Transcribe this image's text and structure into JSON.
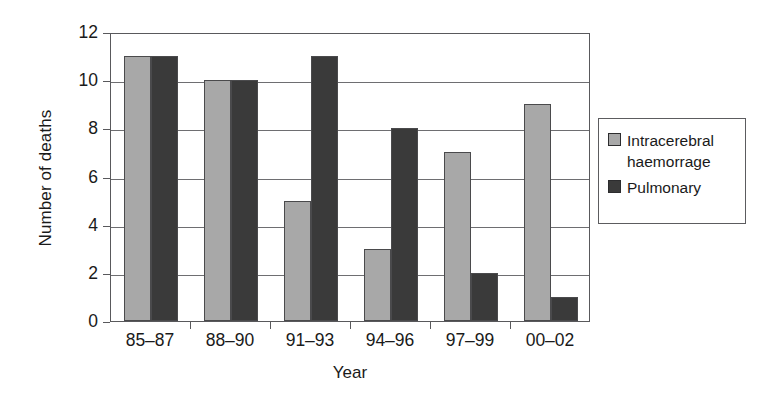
{
  "chart_data": {
    "type": "bar",
    "title": "",
    "xlabel": "Year",
    "ylabel": "Number of deaths",
    "categories": [
      "85–87",
      "88–90",
      "91–93",
      "94–96",
      "97–99",
      "00–02"
    ],
    "series": [
      {
        "name": "Intracerebral haemorrage",
        "values": [
          11,
          10,
          5,
          3,
          7,
          9
        ],
        "color": "#a8a8a8"
      },
      {
        "name": "Pulmonary",
        "values": [
          11,
          10,
          11,
          8,
          2,
          1
        ],
        "color": "#3a3a3a"
      }
    ],
    "ylim": [
      0,
      12
    ],
    "yticks": [
      0,
      2,
      4,
      6,
      8,
      10,
      12
    ],
    "ytick_labels": [
      "0",
      "2",
      "4",
      "6",
      "8",
      "10",
      "12"
    ],
    "grid": true,
    "grid_axis": "y",
    "legend_position": "right",
    "bar_edge_color": "#4a4a4c",
    "axis_color": "#59595c",
    "background": "#ffffff"
  },
  "legend": {
    "entries": [
      {
        "label_line_1": "Intracerebral",
        "label_line_2": "haemorrage"
      },
      {
        "label_line_1": "Pulmonary",
        "label_line_2": ""
      }
    ]
  }
}
